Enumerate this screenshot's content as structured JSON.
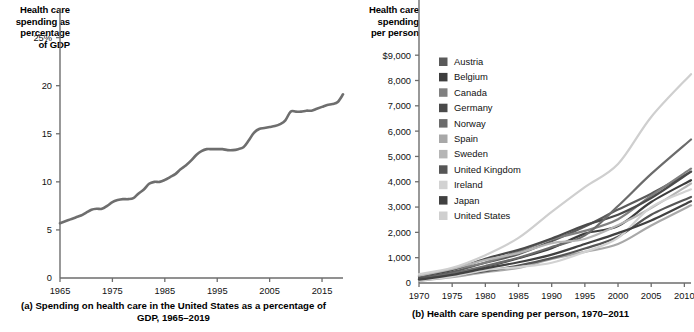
{
  "figure": {
    "panels": [
      {
        "id": "panel-a",
        "axis_title": "Health care\nspending as\npercentage\nof GDP",
        "caption": "(a) Spending on health care in the United States as a\npercentage of GDP, 1965–2019"
      },
      {
        "id": "panel-b",
        "axis_title": "Health care\nspending\nper person",
        "caption": "(b) Health care spending per person, 1970–2011"
      }
    ]
  },
  "chart_data": [
    {
      "type": "line",
      "title": "(a) Spending on health care in the United States as a percentage of GDP, 1965–2019",
      "xlabel": "",
      "ylabel": "Health care spending as percentage of GDP",
      "xlim": [
        1965,
        2019
      ],
      "ylim": [
        0,
        26
      ],
      "grid": false,
      "legend": "none",
      "line_color": "#6e6e6e",
      "xticks": [
        1965,
        1975,
        1985,
        1995,
        2005,
        2015
      ],
      "xtick_labels": [
        "1965",
        "1975",
        "1985",
        "1995",
        "2005",
        "2015"
      ],
      "yticks": [
        0,
        5,
        10,
        15,
        20,
        25
      ],
      "ytick_labels": [
        "0",
        "5",
        "10",
        "15",
        "20",
        "25%"
      ],
      "x": [
        1965,
        1966,
        1967,
        1968,
        1969,
        1970,
        1971,
        1972,
        1973,
        1974,
        1975,
        1976,
        1977,
        1978,
        1979,
        1980,
        1981,
        1982,
        1983,
        1984,
        1985,
        1986,
        1987,
        1988,
        1989,
        1990,
        1991,
        1992,
        1993,
        1994,
        1995,
        1996,
        1997,
        1998,
        1999,
        2000,
        2001,
        2002,
        2003,
        2004,
        2005,
        2006,
        2007,
        2008,
        2009,
        2010,
        2011,
        2012,
        2013,
        2014,
        2015,
        2016,
        2017,
        2018,
        2019
      ],
      "values": [
        5.7,
        5.9,
        6.1,
        6.3,
        6.5,
        6.8,
        7.1,
        7.2,
        7.2,
        7.5,
        7.9,
        8.1,
        8.2,
        8.2,
        8.3,
        8.8,
        9.2,
        9.8,
        10.0,
        10.0,
        10.2,
        10.5,
        10.8,
        11.3,
        11.7,
        12.2,
        12.8,
        13.2,
        13.4,
        13.4,
        13.4,
        13.4,
        13.3,
        13.3,
        13.4,
        13.6,
        14.3,
        15.1,
        15.5,
        15.6,
        15.7,
        15.8,
        16.0,
        16.4,
        17.3,
        17.3,
        17.3,
        17.4,
        17.4,
        17.6,
        17.8,
        18.0,
        18.1,
        18.3,
        19.1
      ]
    },
    {
      "type": "line",
      "title": "(b) Health care spending per person, 1970–2011",
      "xlabel": "",
      "ylabel": "Health care spending per person",
      "xlim": [
        1970,
        2011
      ],
      "ylim": [
        0,
        9600
      ],
      "grid": false,
      "legend": "inside-upper-left",
      "xticks": [
        1970,
        1975,
        1980,
        1985,
        1990,
        1995,
        2000,
        2005,
        2010
      ],
      "xtick_labels": [
        "1970",
        "1975",
        "1980",
        "1985",
        "1990",
        "1995",
        "2000",
        "2005",
        "2010"
      ],
      "yticks": [
        0,
        1000,
        2000,
        3000,
        4000,
        5000,
        6000,
        7000,
        8000,
        9000
      ],
      "ytick_labels": [
        "0",
        "1,000",
        "2,000",
        "3,000",
        "4,000",
        "5,000",
        "6,000",
        "7,000",
        "8,000",
        "$9,000"
      ],
      "x": [
        1970,
        1975,
        1980,
        1985,
        1990,
        1995,
        2000,
        2005,
        2011
      ],
      "series": [
        {
          "name": "Austria",
          "color": "#5a5a5a",
          "values": [
            190,
            430,
            800,
            1140,
            1650,
            2230,
            2900,
            3530,
            4400
          ]
        },
        {
          "name": "Belgium",
          "color": "#3d3d3d",
          "values": [
            150,
            350,
            640,
            980,
            1370,
            1950,
            2250,
            3200,
            4060
          ]
        },
        {
          "name": "Canada",
          "color": "#808080",
          "values": [
            290,
            520,
            810,
            1240,
            1730,
            2060,
            2520,
            3450,
            4520
          ]
        },
        {
          "name": "Germany",
          "color": "#4a4a4a",
          "values": [
            260,
            520,
            960,
            1310,
            1760,
            2280,
            2700,
            3360,
            4400
          ]
        },
        {
          "name": "Norway",
          "color": "#6b6b6b",
          "values": [
            140,
            380,
            670,
            1000,
            1420,
            1880,
            3040,
            4310,
            5670
          ]
        },
        {
          "name": "Spain",
          "color": "#a8a8a8",
          "values": [
            90,
            230,
            430,
            600,
            950,
            1230,
            1540,
            2270,
            3070
          ]
        },
        {
          "name": "Sweden",
          "color": "#b5b5b5",
          "values": [
            290,
            560,
            910,
            1180,
            1570,
            1740,
            2280,
            2960,
            3930
          ]
        },
        {
          "name": "United Kingdom",
          "color": "#565656",
          "values": [
            150,
            290,
            470,
            690,
            980,
            1360,
            1830,
            2700,
            3400
          ]
        },
        {
          "name": "Ireland",
          "color": "#d2d2d2",
          "values": [
            100,
            260,
            510,
            630,
            800,
            1230,
            1780,
            3000,
            3700
          ]
        },
        {
          "name": "Japan",
          "color": "#414141",
          "values": [
            130,
            320,
            580,
            820,
            1120,
            1540,
            1970,
            2470,
            3230
          ]
        },
        {
          "name": "United States",
          "color": "#cfcfcf",
          "values": [
            350,
            600,
            1100,
            1780,
            2810,
            3790,
            4700,
            6560,
            8250
          ]
        }
      ]
    }
  ]
}
